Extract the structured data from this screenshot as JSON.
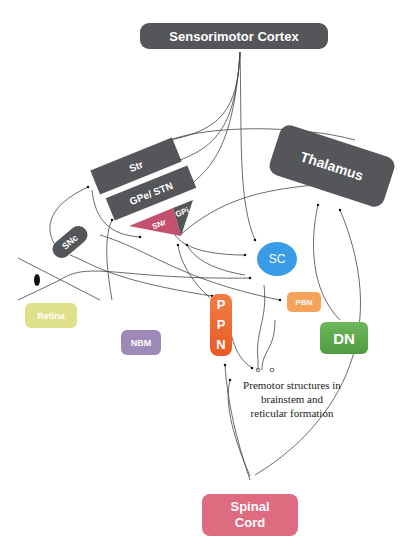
{
  "diagram": {
    "nodes": {
      "sensorimotor_cortex": {
        "label": "Sensorimotor Cortex",
        "color": "#55565a"
      },
      "thalamus": {
        "label": "Thalamus",
        "color": "#55565a"
      },
      "str": {
        "label": "Str",
        "color": "#55565a"
      },
      "gpe_stn": {
        "label": "GPe/ STN",
        "color": "#55565a"
      },
      "snr": {
        "label": "SNr",
        "color": "#c4506e"
      },
      "gpi": {
        "label": "GPi",
        "color": "#55565a"
      },
      "snc": {
        "label": "SNc",
        "color": "#55565a"
      },
      "sc": {
        "label": "SC",
        "color": "#3a9be6"
      },
      "retina": {
        "label": "Retina",
        "color": "#dfe08a"
      },
      "nbm": {
        "label": "NBM",
        "color": "#9d8ab8"
      },
      "ppn": {
        "label": "P P N",
        "color": "#f06a35"
      },
      "pbn": {
        "label": "PBN",
        "color": "#f5a25a"
      },
      "dn": {
        "label": "DN",
        "color": "#5fa84c"
      },
      "spinal_cord": {
        "label": "Spinal Cord",
        "color": "#de6b7f"
      }
    },
    "annotation": {
      "premotor_line1": "Premotor structures in",
      "premotor_line2": "brainstem and",
      "premotor_line3": "reticular formation"
    }
  }
}
